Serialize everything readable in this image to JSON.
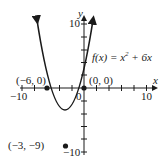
{
  "graph": {
    "function_label_prefix": "f(x) = x",
    "function_exponent": "2",
    "function_label_suffix": " + 6x",
    "x_axis_label": "x",
    "y_axis_label": "y",
    "origin_label": "0",
    "x_min_label": "−10",
    "x_max_label": "10",
    "y_max_label": "10",
    "y_min_label": "−10",
    "points": [
      {
        "label": "(−6, 0)",
        "x": -6,
        "y": 0
      },
      {
        "label": "(0, 0)",
        "x": 0,
        "y": 0
      },
      {
        "label": "(−3, −9)",
        "x": -3,
        "y": -9
      }
    ],
    "colors": {
      "curve": "#1a1a1a",
      "axes": "#1a1a1a",
      "background": "#ffffff"
    }
  }
}
